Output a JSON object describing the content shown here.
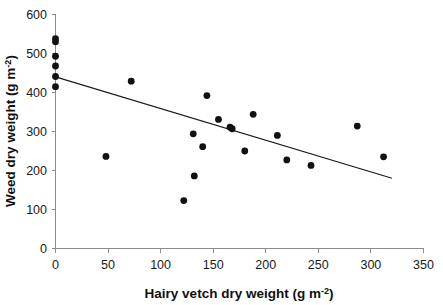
{
  "chart_data": {
    "type": "scatter",
    "title": "",
    "xlabel": "Hairy vetch dry weight (g m-2)",
    "xlabel_main": "Hairy vetch dry weight (g m",
    "xlabel_sup": "-2",
    "xlabel_tail": ")",
    "ylabel": "Weed dry weight (g m-2)",
    "ylabel_main": "Weed dry weight (g m",
    "ylabel_sup": "-2",
    "ylabel_tail": ")",
    "xlim": [
      0,
      350
    ],
    "ylim": [
      0,
      600
    ],
    "xticks": [
      0,
      50,
      100,
      150,
      200,
      250,
      300,
      350
    ],
    "yticks": [
      0,
      100,
      200,
      300,
      400,
      500,
      600
    ],
    "xtick_labels": [
      "0",
      "50",
      "100",
      "150",
      "200",
      "250",
      "300",
      "350"
    ],
    "ytick_labels": [
      "0",
      "100",
      "200",
      "300",
      "400",
      "500",
      "600"
    ],
    "grid": false,
    "legend": false,
    "marker": "filled-circle",
    "marker_color": "#111111",
    "marker_size": 3.4,
    "points": [
      {
        "x": 0,
        "y": 538
      },
      {
        "x": 0,
        "y": 530
      },
      {
        "x": 0,
        "y": 493
      },
      {
        "x": 0,
        "y": 468
      },
      {
        "x": 0,
        "y": 441
      },
      {
        "x": 0,
        "y": 415
      },
      {
        "x": 48,
        "y": 236
      },
      {
        "x": 72,
        "y": 429
      },
      {
        "x": 122,
        "y": 123
      },
      {
        "x": 131,
        "y": 294
      },
      {
        "x": 132,
        "y": 186
      },
      {
        "x": 140,
        "y": 261
      },
      {
        "x": 144,
        "y": 392
      },
      {
        "x": 155,
        "y": 331
      },
      {
        "x": 166,
        "y": 311
      },
      {
        "x": 168,
        "y": 307
      },
      {
        "x": 180,
        "y": 250
      },
      {
        "x": 188,
        "y": 344
      },
      {
        "x": 211,
        "y": 290
      },
      {
        "x": 220,
        "y": 227
      },
      {
        "x": 243,
        "y": 213
      },
      {
        "x": 287,
        "y": 314
      },
      {
        "x": 312,
        "y": 235
      }
    ],
    "trend_line": {
      "x_start": 0,
      "y_start": 440,
      "x_end": 320,
      "y_end": 180,
      "color": "#1a1a1a"
    }
  }
}
